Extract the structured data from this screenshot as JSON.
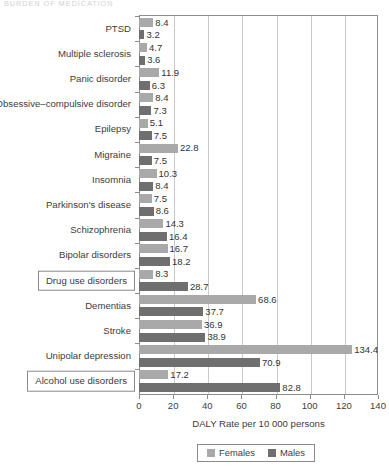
{
  "running_head": "BURDEN OF MEDICATION",
  "legend": {
    "position": "bottom-center",
    "entries": [
      {
        "label": "Females",
        "color": "#a9a9a9"
      },
      {
        "label": "Males",
        "color": "#6f6f6f"
      }
    ]
  },
  "axis": {
    "xlabel": "DALY Rate per 10 000 persons",
    "ticks": [
      "0",
      "20",
      "40",
      "60",
      "80",
      "100",
      "120",
      "140"
    ]
  },
  "boxed_categories": [
    "Drug use disorders",
    "Alcohol use disorders"
  ],
  "chart_data": {
    "type": "bar",
    "orientation": "horizontal",
    "title": "",
    "xlabel": "DALY Rate per 10 000 persons",
    "ylabel": "",
    "xlim": [
      0,
      140
    ],
    "xticks": [
      0,
      20,
      40,
      60,
      80,
      100,
      120,
      140
    ],
    "grid": "vertical",
    "legend_position": "bottom-center",
    "categories": [
      "PTSD",
      "Multiple sclerosis",
      "Panic disorder",
      "Obsessive–compulsive disorder",
      "Epilepsy",
      "Migraine",
      "Insomnia",
      "Parkinson's disease",
      "Schizophrenia",
      "Bipolar disorders",
      "Drug use disorders",
      "Dementias",
      "Stroke",
      "Unipolar depression",
      "Alcohol use disorders"
    ],
    "series": [
      {
        "name": "Females",
        "color": "#a9a9a9",
        "values": [
          8.4,
          4.7,
          11.9,
          8.4,
          5.1,
          22.8,
          10.3,
          7.5,
          14.3,
          16.7,
          8.3,
          68.6,
          36.9,
          134.4,
          17.2
        ]
      },
      {
        "name": "Males",
        "color": "#6f6f6f",
        "values": [
          3.2,
          3.6,
          6.3,
          7.3,
          7.5,
          7.5,
          8.4,
          8.6,
          16.4,
          18.2,
          28.7,
          37.7,
          38.9,
          70.9,
          82.8
        ]
      }
    ]
  }
}
